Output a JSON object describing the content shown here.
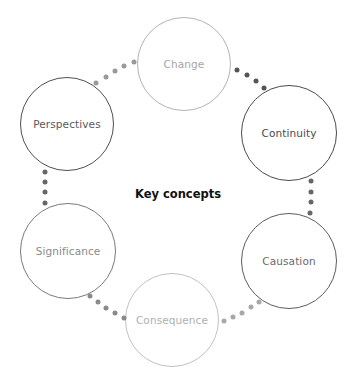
{
  "title": "Key concepts",
  "title_pos": {
    "x": 178,
    "y": 194
  },
  "nodes": [
    {
      "label": "Change",
      "cx": 184,
      "cy": 64,
      "r": 47,
      "border": "#b3b3b3",
      "text": "#a6a6a6",
      "border_width": 1
    },
    {
      "label": "Continuity",
      "cx": 289,
      "cy": 133,
      "r": 48,
      "border": "#4a4a4a",
      "text": "#4a4a4a",
      "border_width": 1.2
    },
    {
      "label": "Causation",
      "cx": 289,
      "cy": 261,
      "r": 48,
      "border": "#5c5c5c",
      "text": "#6a6a6a",
      "border_width": 1.2
    },
    {
      "label": "Consequence",
      "cx": 172,
      "cy": 320,
      "r": 47,
      "border": "#c2c2c2",
      "text": "#b0b0b0",
      "border_width": 1
    },
    {
      "label": "Significance",
      "cx": 68,
      "cy": 251,
      "r": 48,
      "border": "#7a7a7a",
      "text": "#8a8a8a",
      "border_width": 1.1
    },
    {
      "label": "Perspectives",
      "cx": 67,
      "cy": 124,
      "r": 47,
      "border": "#4f4f4f",
      "text": "#5a5a5a",
      "border_width": 1.2
    }
  ],
  "connectors": [
    {
      "from": "Perspectives",
      "to": "Change",
      "color": "#9a9a9a",
      "dots": [
        [
          96,
          83
        ],
        [
          106,
          77
        ],
        [
          115,
          71
        ],
        [
          124,
          66
        ],
        [
          134,
          62
        ]
      ]
    },
    {
      "from": "Change",
      "to": "Continuity",
      "color": "#555555",
      "dots": [
        [
          237,
          70
        ],
        [
          247,
          75
        ],
        [
          256,
          81
        ],
        [
          264,
          88
        ]
      ]
    },
    {
      "from": "Continuity",
      "to": "Causation",
      "color": "#666666",
      "dots": [
        [
          311,
          181
        ],
        [
          311,
          192
        ],
        [
          311,
          202
        ],
        [
          310,
          213
        ]
      ]
    },
    {
      "from": "Causation",
      "to": "Consequence",
      "color": "#a8a8a8",
      "dots": [
        [
          224,
          321
        ],
        [
          233,
          317
        ],
        [
          242,
          313
        ],
        [
          251,
          307
        ],
        [
          259,
          302
        ]
      ]
    },
    {
      "from": "Significance",
      "to": "Consequence",
      "color": "#8a8a8a",
      "dots": [
        [
          90,
          296
        ],
        [
          98,
          302
        ],
        [
          106,
          308
        ],
        [
          115,
          313
        ],
        [
          124,
          318
        ]
      ]
    },
    {
      "from": "Perspectives",
      "to": "Significance",
      "color": "#666666",
      "dots": [
        [
          45,
          172
        ],
        [
          45,
          182
        ],
        [
          45,
          192
        ],
        [
          45,
          203
        ]
      ]
    }
  ]
}
